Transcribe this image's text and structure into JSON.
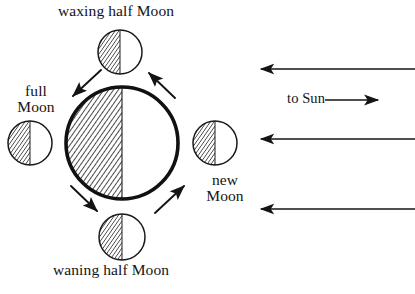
{
  "diagram": {
    "type": "astronomy-phase-diagram",
    "background_color": "#ffffff",
    "ink_color": "#141414"
  },
  "labels": {
    "waxing_half_moon": "waxing half Moon",
    "waning_half_moon": "waning half Moon",
    "full_moon": "full\nMoon",
    "new_moon": "new\nMoon",
    "to_sun": "to Sun"
  },
  "earth": {
    "name": "Earth",
    "center_x": 122,
    "center_y": 143,
    "radius": 56,
    "outline_width": 3.5,
    "shaded_side": "left",
    "lit_side": "right"
  },
  "moons": [
    {
      "id": "waxing-half-moon",
      "position": "top",
      "center_x": 120,
      "center_y": 52,
      "radius": 22,
      "shaded_side": "left",
      "lit_side": "right",
      "label": "waxing half Moon"
    },
    {
      "id": "full-moon",
      "position": "left",
      "center_x": 30,
      "center_y": 143,
      "radius": 22,
      "shaded_side": "left",
      "lit_side": "right",
      "label": "full Moon"
    },
    {
      "id": "new-moon",
      "position": "right",
      "center_x": 215,
      "center_y": 143,
      "radius": 22,
      "shaded_side": "left",
      "lit_side": "right",
      "label": "new Moon"
    },
    {
      "id": "waning-half-moon",
      "position": "bottom",
      "center_x": 122,
      "center_y": 237,
      "radius": 23,
      "shaded_side": "left",
      "lit_side": "right",
      "label": "waning half Moon"
    }
  ],
  "orbit_arrows": {
    "direction": "counterclockwise",
    "count": 4,
    "segments": [
      {
        "id": "arrow-top-left",
        "from": "waxing-half-moon",
        "to": "full-moon",
        "points": "down-left"
      },
      {
        "id": "arrow-bottom-left",
        "from": "full-moon",
        "to": "waning-half-moon",
        "points": "down-right"
      },
      {
        "id": "arrow-bottom-right",
        "from": "waning-half-moon",
        "to": "new-moon",
        "points": "up-right"
      },
      {
        "id": "arrow-top-right",
        "from": "new-moon",
        "to": "waxing-half-moon",
        "points": "up-left"
      }
    ]
  },
  "sunlight_rays": {
    "direction": "right-to-left",
    "count": 3,
    "label": "to Sun",
    "rays": [
      {
        "id": "sunlight-ray-top",
        "y": 69,
        "x_start": 415,
        "x_end": 258
      },
      {
        "id": "sunlight-ray-middle",
        "y": 139,
        "x_start": 415,
        "x_end": 258
      },
      {
        "id": "sunlight-ray-bottom",
        "y": 209,
        "x_start": 415,
        "x_end": 258
      }
    ]
  },
  "to_sun_arrow": {
    "id": "to-sun-arrow",
    "direction": "right",
    "x_start": 324,
    "x_end": 381,
    "y": 100
  }
}
